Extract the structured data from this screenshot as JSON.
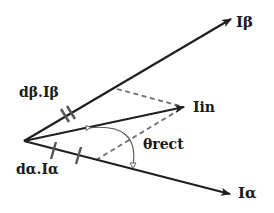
{
  "diagram": {
    "title": "",
    "colors": {
      "axis": "#1f1f1f",
      "dashed": "#6e6e6e",
      "arc": "#555555",
      "tick": "#555555",
      "background": "#ffffff"
    },
    "origin": {
      "x": 24,
      "y": 141
    },
    "vectors": [
      {
        "id": "i_beta",
        "label": "Iβ",
        "to": {
          "x": 231,
          "y": 19
        }
      },
      {
        "id": "i_alpha",
        "label": "Iα",
        "to": {
          "x": 230,
          "y": 194
        }
      },
      {
        "id": "i_in",
        "label": "Iin",
        "to": {
          "x": 184,
          "y": 107
        }
      }
    ],
    "projections": [
      {
        "id": "proj_beta",
        "from": {
          "x": 117,
          "y": 89
        },
        "to": {
          "x": 184,
          "y": 107
        }
      },
      {
        "id": "proj_alpha",
        "from": {
          "x": 96,
          "y": 160
        },
        "to": {
          "x": 184,
          "y": 107
        }
      }
    ],
    "labels": {
      "i_beta": "Iβ",
      "i_alpha": "Iα",
      "i_in": "Iin",
      "theta": "θrect",
      "d_beta": "dβ.Iβ",
      "d_alpha": "dα.Iα"
    },
    "angle": {
      "label": "θrect",
      "from_vector": "i_in",
      "to_vector": "i_alpha"
    }
  }
}
